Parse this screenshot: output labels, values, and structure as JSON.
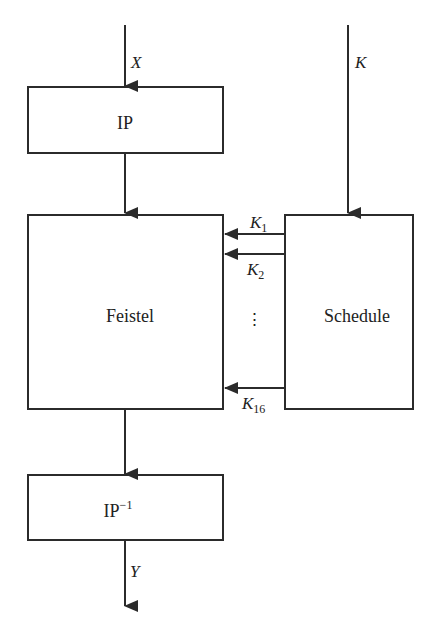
{
  "diagram": {
    "type": "block-diagram",
    "inputs": {
      "plaintext": "X",
      "key": "K"
    },
    "output": {
      "ciphertext": "Y"
    },
    "blocks": {
      "ip": "IP",
      "feistel": "Feistel",
      "schedule": "Schedule",
      "ip_inverse_base": "IP",
      "ip_inverse_sup": "−1"
    },
    "subkeys": {
      "k1_base": "K",
      "k1_sub": "1",
      "k2_base": "K",
      "k2_sub": "2",
      "k16_base": "K",
      "k16_sub": "16",
      "ellipsis": "⋮"
    },
    "colors": {
      "stroke": "#2b2b2b",
      "background": "#ffffff"
    }
  }
}
